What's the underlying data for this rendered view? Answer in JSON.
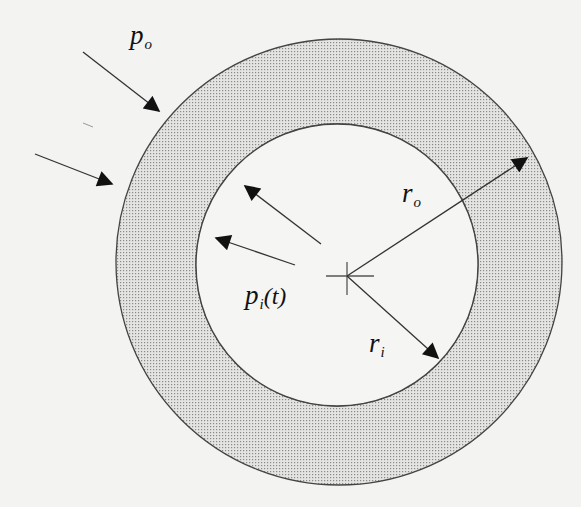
{
  "figure": {
    "type": "pressurized thick-walled cylinder cross-section",
    "colors": {
      "background": "#f3f3f1",
      "wall_fill": "#d9d9d9",
      "stipple_dot": "#8a8a8a",
      "stroke": "#444444",
      "arrow": "#111111"
    },
    "outer_circle": {
      "cx": 339,
      "cy": 262,
      "r": 223
    },
    "inner_circle": {
      "cx": 337,
      "cy": 265,
      "r": 141
    },
    "center_mark": {
      "x": 347,
      "y": 276
    }
  },
  "labels": {
    "outer_pressure": {
      "symbol": "p",
      "subscript": "o"
    },
    "inner_pressure": {
      "symbol": "p",
      "subscript": "i",
      "argument": "(t)"
    },
    "outer_radius": {
      "symbol": "r",
      "subscript": "o"
    },
    "inner_radius": {
      "symbol": "r",
      "subscript": "i"
    }
  },
  "arrows": {
    "outer_pressure": [
      {
        "x1": 83,
        "y1": 52,
        "x2": 159,
        "y2": 111
      },
      {
        "x1": 35,
        "y1": 154,
        "x2": 112,
        "y2": 184
      }
    ],
    "inner_pressure": [
      {
        "x1": 321,
        "y1": 244,
        "x2": 245,
        "y2": 186
      },
      {
        "x1": 295,
        "y1": 265,
        "x2": 216,
        "y2": 238
      }
    ],
    "outer_radius": {
      "x1": 347,
      "y1": 276,
      "x2": 527,
      "y2": 158
    },
    "inner_radius": {
      "x1": 347,
      "y1": 276,
      "x2": 438,
      "y2": 358
    }
  }
}
